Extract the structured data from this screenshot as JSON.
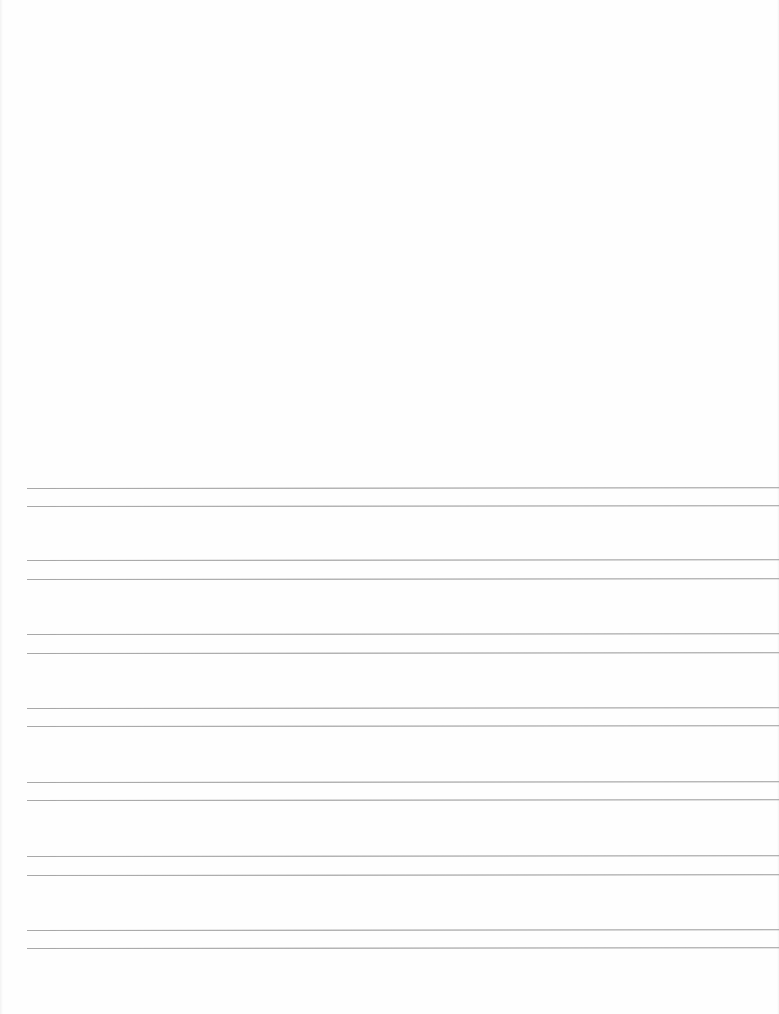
{
  "document": {
    "type": "ruled-writing-sheet",
    "background_color": "#fefefe",
    "line_color": "#9a9a9a",
    "upper_area": "blank",
    "line_pairs": [
      {
        "top": 488,
        "bottom": 506
      },
      {
        "top": 560,
        "bottom": 579
      },
      {
        "top": 634,
        "bottom": 653
      },
      {
        "top": 708,
        "bottom": 726
      },
      {
        "top": 782,
        "bottom": 800
      },
      {
        "top": 856,
        "bottom": 875
      },
      {
        "top": 930,
        "bottom": 948
      }
    ],
    "line_start_x": 27,
    "line_end_x": 779
  }
}
